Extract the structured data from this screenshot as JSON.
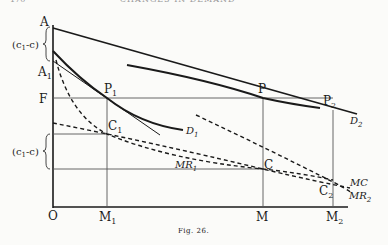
{
  "header": {
    "page_number": "170",
    "running_title": "CHANGES IN DEMAND"
  },
  "figure": {
    "caption": "Fig. 26.",
    "axis_labels": {
      "origin": "O",
      "y_top": "A",
      "a1": "A",
      "a1_sub": "1",
      "f": "F"
    },
    "bracket_labels": {
      "upper": "(c",
      "upper_sub": "1",
      "upper_tail": "-c)",
      "lower": "(c",
      "lower_sub": "1",
      "lower_tail": "-c)"
    },
    "x_labels": {
      "m1": "M",
      "m1_sub": "1",
      "m": "M",
      "m2": "M",
      "m2_sub": "2"
    },
    "points": {
      "p1": "P",
      "p1_sub": "1",
      "p": "P",
      "p2": "P",
      "p2_sub": "2",
      "c1": "C",
      "c1_sub": "1",
      "c": "C",
      "c2": "C",
      "c2_sub": "2"
    },
    "curve_labels": {
      "d1": "D",
      "d1_sub": "1",
      "d2": "D",
      "d2_sub": "2",
      "mr1": "MR",
      "mr1_sub": "1",
      "mr2": "MR",
      "mr2_sub": "2",
      "mc": "MC"
    },
    "colors": {
      "ink": "#1a1a1a",
      "paper": "#fbfbf9"
    }
  }
}
